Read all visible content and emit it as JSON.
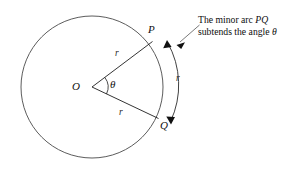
{
  "figure": {
    "type": "geometry-diagram",
    "background_color": "#ffffff",
    "line_color": "#1d1d1d",
    "circle_color": "#4a4a4a"
  },
  "labels": {
    "center": "O",
    "point_upper": "P",
    "point_lower": "Q",
    "angle": "θ",
    "radius_upper": "r",
    "radius_lower": "r",
    "arc_length": "r"
  },
  "annotation": {
    "line1_prefix": "The minor arc ",
    "line1_italic": "PQ",
    "line2_prefix": "subtends the angle ",
    "line2_italic": "θ",
    "full_text": "The minor arc PQ subtends the angle θ"
  },
  "geometry": {
    "circle_center_x": 92,
    "circle_center_y": 87,
    "circle_radius": 71,
    "point_p_x": 152,
    "point_p_y": 42,
    "point_q_x": 158,
    "point_q_y": 118,
    "angle_arc_radius": 16,
    "outer_arc_radius": 85
  }
}
